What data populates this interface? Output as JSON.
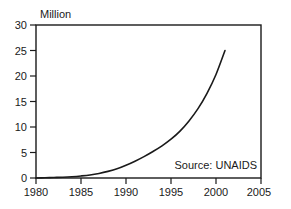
{
  "chart_data": {
    "type": "line",
    "title": "",
    "subtitle": "",
    "xlabel": "",
    "ylabel": "Million",
    "ylabel_position": "top-left",
    "xlim": [
      1980,
      2005
    ],
    "ylim": [
      0,
      30
    ],
    "grid": false,
    "legend": false,
    "x_ticks": [
      1980,
      1985,
      1990,
      1995,
      2000,
      2005
    ],
    "x_tick_labels": [
      "1980",
      "1985",
      "1990",
      "1995",
      "2000",
      "2005"
    ],
    "y_ticks": [
      0,
      5,
      10,
      15,
      20,
      25,
      30
    ],
    "y_tick_labels": [
      "0",
      "5",
      "10",
      "15",
      "20",
      "25",
      "30"
    ],
    "annotations": [
      {
        "name": "source-note",
        "text": "Source: UNAIDS",
        "x": 2000.5,
        "y": 3.5
      }
    ],
    "series": [
      {
        "name": "People living with HIV/AIDS",
        "color": "#1a1a1a",
        "x": [
          1980,
          1981,
          1982,
          1983,
          1984,
          1985,
          1986,
          1987,
          1988,
          1989,
          1990,
          1991,
          1992,
          1993,
          1994,
          1995,
          1996,
          1997,
          1998,
          1999,
          2000,
          2001
        ],
        "values": [
          0.0,
          0.05,
          0.1,
          0.15,
          0.25,
          0.4,
          0.6,
          0.9,
          1.3,
          1.8,
          2.5,
          3.3,
          4.2,
          5.2,
          6.3,
          7.6,
          9.2,
          11.2,
          13.6,
          16.6,
          20.3,
          25.0
        ]
      }
    ]
  },
  "axis": {
    "y_title": "Million"
  }
}
